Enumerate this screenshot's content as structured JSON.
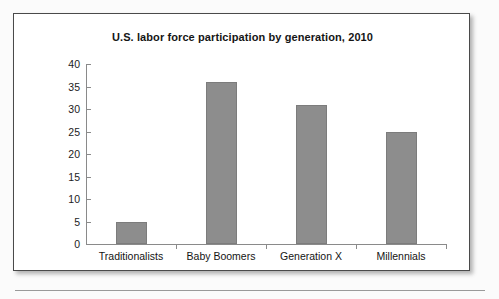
{
  "chart_data": {
    "type": "bar",
    "title": "U.S. labor force participation by generation, 2010",
    "xlabel": "",
    "ylabel": "",
    "categories": [
      "Traditionalists",
      "Baby Boomers",
      "Generation X",
      "Millennials"
    ],
    "values": [
      5,
      36,
      31,
      25
    ],
    "ylim": [
      0,
      40
    ],
    "ytick_step": 5,
    "yticks": [
      "40",
      "35",
      "30",
      "25",
      "20",
      "15",
      "10",
      "5",
      "0"
    ],
    "grid": false,
    "legend": null,
    "series": [
      {
        "name": "U.S. labor force participation",
        "values": [
          5,
          36,
          31,
          25
        ]
      }
    ],
    "bar_color": "#8d8d8d",
    "bar_edge_color": "#7c7c7c",
    "axis_color": "#8a8a8a",
    "text_color": "#141414"
  },
  "figure": {
    "border_color": "#4a4a4a",
    "background_color": "#ffffff"
  },
  "page": {
    "background_color": "#fbfbfb",
    "rule_color": "#9a9a9a"
  }
}
